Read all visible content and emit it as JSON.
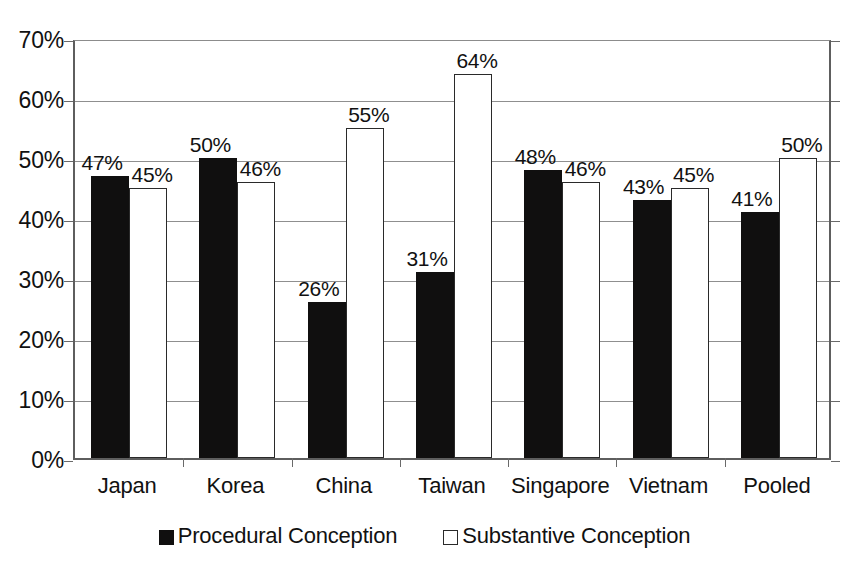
{
  "chart_data": {
    "type": "bar",
    "title": "",
    "xlabel": "",
    "ylabel": "",
    "ylim": [
      0,
      70
    ],
    "ytick_labels": [
      "70%",
      "60%",
      "50%",
      "40%",
      "30%",
      "20%",
      "10%",
      "0%"
    ],
    "ytick_values": [
      70,
      60,
      50,
      40,
      30,
      20,
      10,
      0
    ],
    "grid": true,
    "legend_position": "bottom-center",
    "categories": [
      "Japan",
      "Korea",
      "China",
      "Taiwan",
      "Singapore",
      "Vietnam",
      "Pooled"
    ],
    "series": [
      {
        "name": "Procedural Conception",
        "swatch": "filled-square",
        "color": "#100f0f",
        "values": [
          47,
          50,
          26,
          31,
          48,
          43,
          41
        ],
        "labels": [
          "47%",
          "50%",
          "26%",
          "31%",
          "48%",
          "43%",
          "41%"
        ]
      },
      {
        "name": "Substantive Conception",
        "swatch": "hollow-square",
        "color": "#ffffff",
        "values": [
          45,
          46,
          55,
          64,
          46,
          45,
          50
        ],
        "labels": [
          "45%",
          "46%",
          "55%",
          "64%",
          "46%",
          "45%",
          "50%"
        ]
      }
    ]
  }
}
